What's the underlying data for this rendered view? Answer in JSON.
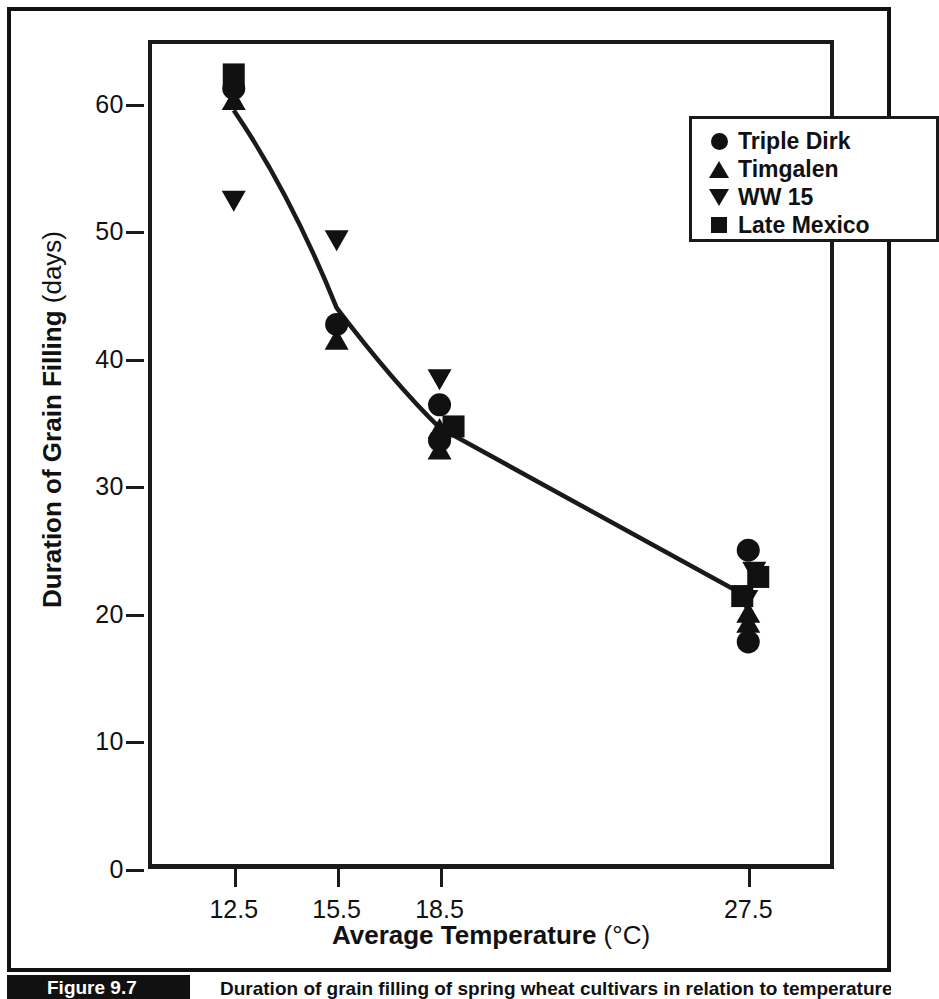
{
  "figure": {
    "tag": "Figure 9.7",
    "caption": "Duration of grain filling of spring wheat cultivars in relation to temperature."
  },
  "chart_data": {
    "type": "scatter",
    "title": "",
    "xlabel": "Average Temperature",
    "xunit": "(°C)",
    "ylabel": "Duration of Grain Filling",
    "yunit": "(days)",
    "xlim": [
      10.0,
      30.0
    ],
    "ylim": [
      0,
      65
    ],
    "xticks": [
      12.5,
      15.5,
      18.5,
      27.5
    ],
    "xtick_labels": [
      "12.5",
      "15.5",
      "18.5",
      "27.5"
    ],
    "yticks": [
      0,
      10,
      20,
      30,
      40,
      50,
      60
    ],
    "ytick_labels": [
      "0",
      "10",
      "20",
      "30",
      "40",
      "50",
      "60"
    ],
    "grid": false,
    "legend_position": "top-right",
    "marker_color": "#111111",
    "line_color": "#1a1a1a",
    "series": [
      {
        "name": "Triple Dirk",
        "marker": "circle",
        "x": [
          12.5,
          15.5,
          18.5,
          18.5,
          27.5,
          27.5
        ],
        "y": [
          61.2,
          42.7,
          36.4,
          33.6,
          25.0,
          17.8
        ]
      },
      {
        "name": "Timgalen",
        "marker": "triangle-up",
        "x": [
          12.5,
          15.5,
          18.5,
          18.5,
          27.5,
          27.5
        ],
        "y": [
          60.3,
          41.5,
          34.5,
          32.9,
          20.1,
          19.3
        ]
      },
      {
        "name": "WW 15",
        "marker": "triangle-down",
        "x": [
          12.5,
          15.5,
          18.5,
          27.5,
          27.5
        ],
        "y": [
          52.4,
          49.3,
          38.4,
          23.3,
          21.1
        ]
      },
      {
        "name": "Late Mexico",
        "marker": "square",
        "x": [
          12.5,
          18.5,
          27.5,
          27.5
        ],
        "y": [
          62.3,
          34.7,
          22.9,
          21.4
        ]
      }
    ],
    "trend_line": {
      "label": "mean trend",
      "x": [
        12.5,
        15.5,
        18.5,
        27.5
      ],
      "y": [
        59.5,
        44.0,
        34.6,
        21.3
      ]
    }
  },
  "legend": {
    "items": [
      {
        "label": "Triple Dirk",
        "marker": "circle"
      },
      {
        "label": "Timgalen",
        "marker": "triangle-up"
      },
      {
        "label": "WW 15",
        "marker": "triangle-down"
      },
      {
        "label": "Late Mexico",
        "marker": "square"
      }
    ]
  }
}
